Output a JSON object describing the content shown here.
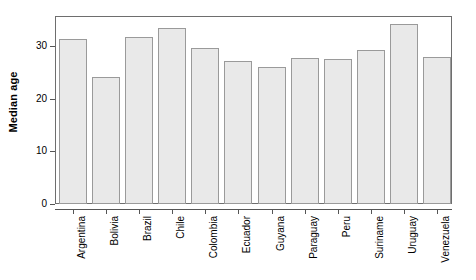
{
  "chart_data": {
    "type": "bar",
    "title": "",
    "subtitle": "",
    "xlabel": "",
    "ylabel": "Median age",
    "categories": [
      "Argentina",
      "Bolivia",
      "Brazil",
      "Chile",
      "Colombia",
      "Ecuador",
      "Guyana",
      "Paraguay",
      "Peru",
      "Suriname",
      "Uruguay",
      "Venezuela"
    ],
    "values": [
      31.5,
      24.2,
      31.8,
      33.5,
      29.7,
      27.2,
      26.0,
      27.8,
      27.6,
      29.4,
      34.3,
      27.9
    ],
    "ylim": [
      0,
      35.8
    ],
    "yticks": [
      0,
      10,
      20,
      30
    ],
    "ytick_labels": [
      "0",
      "10",
      "20",
      "30"
    ],
    "grid": false,
    "legend": null,
    "bar_fill_color": "#e9e9e9",
    "bar_border_color": "#9a9a9a",
    "axis_color": "#555555",
    "frame_color": "#6e6e6e",
    "background_color": "#ffffff"
  }
}
